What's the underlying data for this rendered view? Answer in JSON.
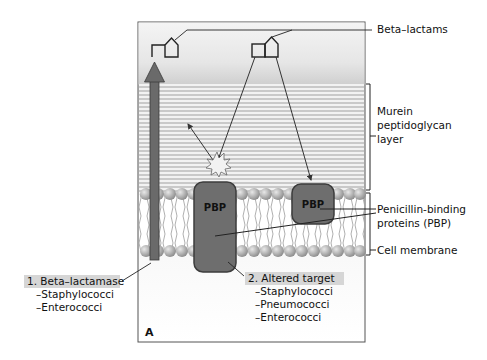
{
  "diagram": {
    "panel_letter": "A",
    "labels": {
      "beta_lactams": "Beta–lactams",
      "murein_line1": "Murein",
      "murein_line2": "peptidoglycan",
      "murein_line3": "layer",
      "pbp_line1": "Penicillin-binding",
      "pbp_line2": "proteins (PBP)",
      "cell_membrane": "Cell membrane"
    },
    "proteins": [
      {
        "label": "PBP"
      },
      {
        "label": "PBP"
      }
    ],
    "mechanisms": [
      {
        "title": "1. Beta–lactamase",
        "organisms": [
          "–Staphylococci",
          "–Enterococci"
        ]
      },
      {
        "title": "2. Altered target",
        "organisms": [
          "–Staphylococci",
          "–Pneumococci",
          "–Enterococci"
        ]
      }
    ],
    "colors": {
      "protein": "#6e6e6e",
      "peptidoglycan_line": "#9a9a9a",
      "membrane_head": "#a8a8a8",
      "label_highlight": "#d6d6d6",
      "arrow": "#6a6a6a"
    }
  }
}
